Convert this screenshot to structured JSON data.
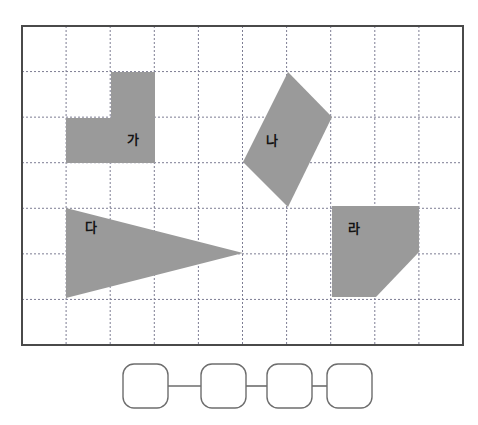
{
  "page": {
    "background_color": "#ffffff",
    "width": 478,
    "height": 425
  },
  "grid": {
    "name": "dotted-square-grid",
    "border_color": "#4a4a4a",
    "gridline_color": "#7d7d93",
    "gridline_style": "dotted",
    "x0": 22,
    "y0": 26,
    "x1": 463,
    "y1": 345,
    "columns": 10,
    "rows": 7,
    "cell_width": 44.1,
    "cell_height": 45.6
  },
  "shapes": {
    "fill_color": "#9a9a9a",
    "items": [
      {
        "id": "shape-ga",
        "label": "가",
        "type": "pentagon-step",
        "label_x": 133,
        "label_y": 140,
        "points": "111,72 155,72 155,163 66,163 66,118 111,118",
        "area_cells": 3
      },
      {
        "id": "shape-na",
        "label": "나",
        "type": "quadrilateral-kite",
        "label_x": 272,
        "label_y": 141,
        "points": "288,72 332,117 288,207 243,162",
        "area_cells": 3
      },
      {
        "id": "shape-da",
        "label": "다",
        "type": "triangle",
        "label_x": 91,
        "label_y": 228,
        "points": "66,208 243,253 66,298",
        "area_cells": 4
      },
      {
        "id": "shape-ra",
        "label": "라",
        "type": "pentagon-clipped-square",
        "label_x": 354,
        "label_y": 229,
        "points": "332,206 419,206 419,252 376,297 332,297",
        "area_cells": 3
      }
    ]
  },
  "answer_chain": {
    "name": "ordering-answer-boxes",
    "box_stroke_color": "#6d6d6d",
    "box_fill": "#ffffff",
    "connector_color": "#6d6d6d",
    "box_width": 45,
    "box_height": 44,
    "box_radius": 11,
    "box_y": 364,
    "boxes": [
      {
        "id": "answer-box-1",
        "x": 123,
        "value": ""
      },
      {
        "id": "answer-box-2",
        "x": 201,
        "value": ""
      },
      {
        "id": "answer-box-3",
        "x": 267,
        "value": ""
      },
      {
        "id": "answer-box-4",
        "x": 327,
        "value": ""
      }
    ],
    "connectors": [
      {
        "id": "connector-1-2",
        "x1": 168,
        "x2": 201,
        "y": 386
      },
      {
        "id": "connector-2-3",
        "x1": 246,
        "x2": 267,
        "y": 386
      },
      {
        "id": "connector-3-4",
        "x1": 312,
        "x2": 327,
        "y": 386
      }
    ]
  }
}
